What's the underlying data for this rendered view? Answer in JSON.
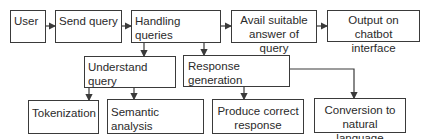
{
  "diagram": {
    "type": "flowchart",
    "nodes": {
      "user": "User",
      "send_query": "Send query",
      "handling_queries": "Handling queries",
      "avail_answer": "Avail suitable answer of query",
      "avail_answer_line1": "Avail suitable",
      "avail_answer_line2": "answer of query",
      "output": "Output on chatbot interface",
      "output_line1": "Output on",
      "output_line2": "chatbot interface",
      "understand_query": "Understand query",
      "response_generation": "Response generation",
      "tokenization": "Tokenization",
      "semantic_analysis": "Semantic analysis",
      "produce_response_line1": "Produce correct",
      "produce_response_line2": "response",
      "conversion_line1": "Conversion to",
      "conversion_line2": "natural language"
    },
    "edges": [
      [
        "User",
        "Send query"
      ],
      [
        "Send query",
        "Handling queries"
      ],
      [
        "Handling queries",
        "Avail suitable answer of query"
      ],
      [
        "Avail suitable answer of query",
        "Output on chatbot interface"
      ],
      [
        "Handling queries",
        "Understand query"
      ],
      [
        "Handling queries",
        "Response generation"
      ],
      [
        "Understand query",
        "Tokenization"
      ],
      [
        "Understand query",
        "Semantic analysis"
      ],
      [
        "Response generation",
        "Produce correct response"
      ],
      [
        "Response generation",
        "Conversion to natural language"
      ]
    ],
    "colors": {
      "line": "#3a3a3a",
      "background": "#ffffff"
    }
  }
}
